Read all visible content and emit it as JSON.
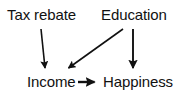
{
  "diagram": {
    "type": "causal-path-diagram",
    "background_color": "#ffffff",
    "ink_color": "#111111",
    "nodes": [
      {
        "id": "tax_rebate",
        "label": "Tax rebate",
        "x": 7,
        "y": 7,
        "row": "top"
      },
      {
        "id": "education",
        "label": "Education",
        "x": 101,
        "y": 7,
        "row": "top"
      },
      {
        "id": "income",
        "label": "Income",
        "x": 27,
        "y": 74,
        "row": "bottom"
      },
      {
        "id": "happiness",
        "label": "Happiness",
        "x": 103,
        "y": 74,
        "row": "bottom"
      }
    ],
    "edges": [
      {
        "id": "tax_rebate_to_income",
        "from": "tax_rebate",
        "to": "income",
        "style": "arrow",
        "orientation": "vertical-slanted",
        "x1": 41,
        "y1": 29,
        "x2": 45,
        "y2": 71
      },
      {
        "id": "education_to_income",
        "from": "education",
        "to": "income",
        "style": "arrow",
        "orientation": "diagonal",
        "x1": 123,
        "y1": 29,
        "x2": 65,
        "y2": 71
      },
      {
        "id": "education_to_happiness",
        "from": "education",
        "to": "happiness",
        "style": "arrow",
        "orientation": "vertical",
        "x1": 133,
        "y1": 29,
        "x2": 133,
        "y2": 71
      },
      {
        "id": "income_to_happiness",
        "from": "income",
        "to": "happiness",
        "style": "arrow",
        "orientation": "horizontal",
        "x1": 78,
        "y1": 82,
        "x2": 99,
        "y2": 82
      }
    ]
  }
}
